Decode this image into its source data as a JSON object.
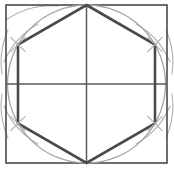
{
  "figure": {
    "canvas": {
      "width": 174,
      "height": 171
    },
    "background_color": "#ffffff"
  },
  "colors": {
    "square_stroke": "#4a4a4a",
    "circle_stroke": "#a6a6a6",
    "hexagon_stroke": "#4a4a4a",
    "axis_stroke": "#5a5a5a",
    "arc_stroke": "#b0b0b0"
  },
  "strokes": {
    "square_width": 1.6,
    "circle_width": 1.3,
    "hexagon_width": 2.6,
    "axis_width": 1.5,
    "arc_width": 1.1
  },
  "square": {
    "label": "bounding-square",
    "x": 6,
    "y": 5,
    "width": 161,
    "height": 158,
    "left": 6,
    "top": 5,
    "right": 167,
    "bottom": 163
  },
  "circle": {
    "label": "inscribed-circle",
    "cx": 86.5,
    "cy": 84,
    "r": 79
  },
  "center_point": {
    "label": "center",
    "x": 86.5,
    "y": 84
  },
  "axes": {
    "horizontal": {
      "x1": 6,
      "y1": 84,
      "x2": 167,
      "y2": 84
    },
    "vertical": {
      "x1": 86.5,
      "y1": 5,
      "x2": 86.5,
      "y2": 163
    }
  },
  "hexagon": {
    "label": "inscribed-regular-hexagon",
    "sides": 6,
    "vertices": [
      {
        "name": "top",
        "x": 86.5,
        "y": 5
      },
      {
        "name": "upper-right",
        "x": 155,
        "y": 44.5
      },
      {
        "name": "lower-right",
        "x": 155,
        "y": 123.5
      },
      {
        "name": "bottom",
        "x": 86.5,
        "y": 163
      },
      {
        "name": "lower-left",
        "x": 18,
        "y": 123.5
      },
      {
        "name": "upper-left",
        "x": 18,
        "y": 44.5
      }
    ],
    "points_attr": "86.5,5 155,44.5 155,123.5 86.5,163 18,123.5 18,44.5"
  },
  "construction_arcs": [
    {
      "name": "arc-from-top-left-region",
      "d": "M 6 18 A 79 79 0 0 1 60 6"
    },
    {
      "name": "arc-crossing-upper-left",
      "d": "M 2 58 A 79 79 0 0 1 40 22"
    },
    {
      "name": "arc-crossing-upper-right",
      "d": "M 134 22 A 79 79 0 0 1 171 58"
    },
    {
      "name": "arc-crossing-lower-left",
      "d": "M 2 110 A 79 79 0 0 0 40 146"
    },
    {
      "name": "arc-crossing-lower-right",
      "d": "M 134 146 A 79 79 0 0 0 171 110"
    }
  ],
  "cross_marks": [
    {
      "name": "cross-mark-upper-left",
      "cx": 18,
      "cy": 44.5
    },
    {
      "name": "cross-mark-upper-right",
      "cx": 155,
      "cy": 44.5
    },
    {
      "name": "cross-mark-lower-left",
      "cx": 18,
      "cy": 123.5
    },
    {
      "name": "cross-mark-lower-right",
      "cx": 155,
      "cy": 123.5
    }
  ],
  "labels": {
    "none_visible": ""
  }
}
